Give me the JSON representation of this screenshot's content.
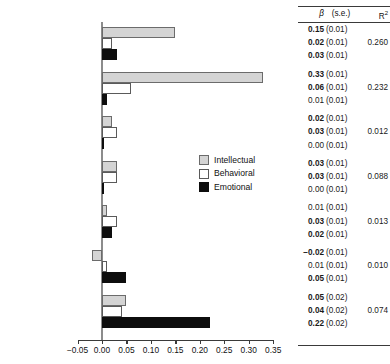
{
  "chart_data": {
    "type": "bar",
    "orientation": "horizontal",
    "title": "",
    "xlabel": "",
    "ylabel": "",
    "xlim": [
      -0.05,
      0.35
    ],
    "xticks": [
      "-0.05",
      "0.00",
      "0.05",
      "0.10",
      "0.15",
      "0.20",
      "0.25",
      "0.30",
      "0.35"
    ],
    "xtick_values": [
      -0.05,
      0.0,
      0.05,
      0.1,
      0.15,
      0.2,
      0.25,
      0.3,
      0.35
    ],
    "grid": false,
    "legend_position": "center-right",
    "categories": [
      "Income",
      "Qualifications",
      "Not unemployed",
      "Noncriminality",
      "Partnered",
      "Physical health",
      "Emotional health"
    ],
    "series": [
      {
        "name": "Intellectual",
        "color": "#d4d4d4",
        "values": [
          0.15,
          0.33,
          0.02,
          0.03,
          0.01,
          -0.02,
          0.05
        ]
      },
      {
        "name": "Behavioral",
        "color": "#ffffff",
        "values": [
          0.02,
          0.06,
          0.03,
          0.03,
          0.03,
          0.01,
          0.04
        ]
      },
      {
        "name": "Emotional",
        "color": "#0d0d0d",
        "values": [
          0.03,
          0.01,
          0.0,
          0.0,
          0.02,
          0.05,
          0.22
        ]
      }
    ]
  },
  "legend": {
    "items": [
      {
        "label": "Intellectual",
        "swatch": "intellectual"
      },
      {
        "label": "Behavioral",
        "swatch": "behavioral"
      },
      {
        "label": "Emotional",
        "swatch": "emotional"
      }
    ]
  },
  "stats_table": {
    "header": {
      "beta": "β",
      "se": "(s.e.)",
      "r2": "R",
      "r2_sup": "2"
    },
    "groups": [
      {
        "category": "Income",
        "rows": [
          {
            "beta": "0.15",
            "se": "(0.01)",
            "r2": "",
            "bold": true
          },
          {
            "beta": "0.02",
            "se": "(0.01)",
            "r2": "0.260",
            "bold": true
          },
          {
            "beta": "0.03",
            "se": "(0.01)",
            "r2": "",
            "bold": true
          }
        ]
      },
      {
        "category": "Qualifications",
        "rows": [
          {
            "beta": "0.33",
            "se": "(0.01)",
            "r2": "",
            "bold": true
          },
          {
            "beta": "0.06",
            "se": "(0.01)",
            "r2": "0.232",
            "bold": true
          },
          {
            "beta": "0.01",
            "se": "(0.01)",
            "r2": "",
            "bold": false
          }
        ]
      },
      {
        "category": "Not unemployed",
        "rows": [
          {
            "beta": "0.02",
            "se": "(0.01)",
            "r2": "",
            "bold": true
          },
          {
            "beta": "0.03",
            "se": "(0.01)",
            "r2": "0.012",
            "bold": true
          },
          {
            "beta": "0.00",
            "se": "(0.01)",
            "r2": "",
            "bold": false
          }
        ]
      },
      {
        "category": "Noncriminality",
        "rows": [
          {
            "beta": "0.03",
            "se": "(0.01)",
            "r2": "",
            "bold": true
          },
          {
            "beta": "0.03",
            "se": "(0.01)",
            "r2": "0.088",
            "bold": true
          },
          {
            "beta": "0.00",
            "se": "(0.01)",
            "r2": "",
            "bold": false
          }
        ]
      },
      {
        "category": "Partnered",
        "rows": [
          {
            "beta": "0.01",
            "se": "(0.01)",
            "r2": "",
            "bold": false
          },
          {
            "beta": "0.03",
            "se": "(0.01)",
            "r2": "0.013",
            "bold": true
          },
          {
            "beta": "0.02",
            "se": "(0.01)",
            "r2": "",
            "bold": true
          }
        ]
      },
      {
        "category": "Physical health",
        "rows": [
          {
            "beta": "−0.02",
            "se": "(0.01)",
            "r2": "",
            "bold": true
          },
          {
            "beta": "0.01",
            "se": "(0.01)",
            "r2": "0.010",
            "bold": false
          },
          {
            "beta": "0.05",
            "se": "(0.01)",
            "r2": "",
            "bold": true
          }
        ]
      },
      {
        "category": "Emotional health",
        "rows": [
          {
            "beta": "0.05",
            "se": "(0.02)",
            "r2": "",
            "bold": true
          },
          {
            "beta": "0.04",
            "se": "(0.02)",
            "r2": "0.074",
            "bold": true
          },
          {
            "beta": "0.22",
            "se": "(0.02)",
            "r2": "",
            "bold": true
          }
        ]
      }
    ]
  }
}
